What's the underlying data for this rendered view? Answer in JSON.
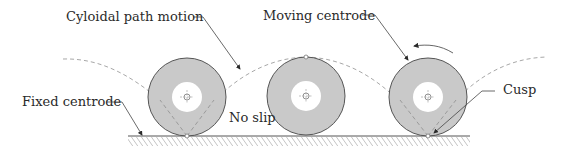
{
  "diagram": {
    "type": "rolling-wheel-centrodes",
    "labels": {
      "cycloid": "Cyloidal path motion",
      "moving_centrode": "Moving centrode",
      "fixed_centrode": "Fixed centrode",
      "no_slip": "No slip",
      "cusp": "Cusp"
    },
    "wheels": [
      {
        "cx": 187,
        "cy": 97,
        "r": 39,
        "hub_r": 15
      },
      {
        "cx": 306,
        "cy": 96,
        "r": 39,
        "hub_r": 15
      },
      {
        "cx": 428,
        "cy": 97,
        "r": 39,
        "hub_r": 15
      }
    ],
    "ground": {
      "y": 136,
      "x_start": 128,
      "x_end": 470
    },
    "colors": {
      "wheel_fill": "#c9c9c9",
      "wheel_stroke": "#555555",
      "hub_fill": "#ffffff",
      "dash": "#a8a8a8",
      "line": "#3a3a3a",
      "text": "#2a2a2a"
    },
    "rotation_direction": "counter-clockwise"
  }
}
